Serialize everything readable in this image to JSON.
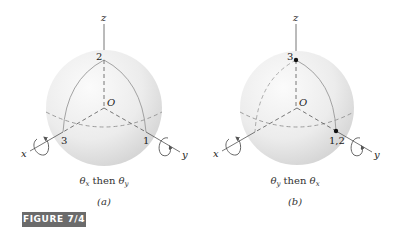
{
  "figure": {
    "label": "FIGURE 7/4",
    "label_bg": "#6b6b6b"
  },
  "panels": [
    {
      "id": "a",
      "axes": {
        "x": "x",
        "y": "y",
        "z": "z",
        "origin": "O"
      },
      "points": {
        "top": "2",
        "left": "3",
        "right": "1"
      },
      "caption_theta1": "θ",
      "caption_sub1": "x",
      "caption_mid": " then ",
      "caption_theta2": "θ",
      "caption_sub2": "y",
      "sublabel": "(a)"
    },
    {
      "id": "b",
      "axes": {
        "x": "x",
        "y": "y",
        "z": "z",
        "origin": "O"
      },
      "points": {
        "top": "3",
        "right": "1,2"
      },
      "caption_theta1": "θ",
      "caption_sub1": "y",
      "caption_mid": " then ",
      "caption_theta2": "θ",
      "caption_sub2": "x",
      "sublabel": "(b)"
    }
  ]
}
